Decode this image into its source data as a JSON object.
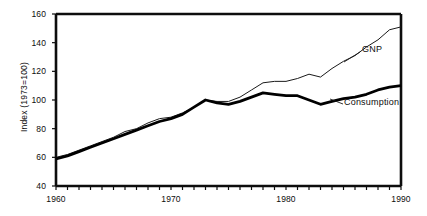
{
  "chart_data": {
    "type": "line",
    "title": "",
    "xlabel": "",
    "ylabel": "Index (1973=100)",
    "xlim": [
      1960,
      1990
    ],
    "ylim": [
      40,
      160
    ],
    "grid": false,
    "legend_position": "inline-annotations",
    "x_tick_labels": [
      "1960",
      "1970",
      "1980",
      "1990"
    ],
    "x_tick_values": [
      1960,
      1970,
      1980,
      1990
    ],
    "y_tick_labels": [
      "40",
      "60",
      "80",
      "100",
      "120",
      "140",
      "160"
    ],
    "y_tick_values": [
      40,
      60,
      80,
      100,
      120,
      140,
      160
    ],
    "x": [
      1960,
      1961,
      1962,
      1963,
      1964,
      1965,
      1966,
      1967,
      1968,
      1969,
      1970,
      1971,
      1972,
      1973,
      1974,
      1975,
      1976,
      1977,
      1978,
      1979,
      1980,
      1981,
      1982,
      1983,
      1984,
      1985,
      1986,
      1987,
      1988,
      1989,
      1990
    ],
    "series": [
      {
        "name": "GNP",
        "style": "thin",
        "values": [
          60,
          62,
          65,
          68,
          71,
          74,
          78,
          80,
          84,
          87,
          88,
          91,
          95,
          100,
          99,
          99,
          102,
          107,
          112,
          113,
          113,
          115,
          118,
          116,
          122,
          127,
          131,
          137,
          142,
          149,
          151
        ]
      },
      {
        "name": "Consumption",
        "style": "thick",
        "values": [
          59,
          61,
          64,
          67,
          70,
          73,
          76,
          79,
          82,
          85,
          87,
          90,
          95,
          100,
          98,
          97,
          99,
          102,
          105,
          104,
          103,
          103,
          100,
          97,
          99,
          101,
          102,
          104,
          107,
          109,
          110
        ]
      }
    ],
    "annotations": [
      {
        "text": "GNP",
        "series": "GNP"
      },
      {
        "text": "Consumption",
        "series": "Consumption"
      }
    ],
    "axis_color": "#0d0d0d",
    "gnp_line_color": "#1a1a1a",
    "consumption_line_color": "#000000"
  }
}
